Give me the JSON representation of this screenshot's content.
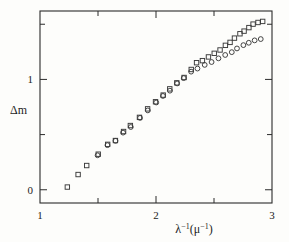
{
  "figure": {
    "background_color": "#fdfdfb",
    "ink_color": "#2b2b2b"
  },
  "chart_data": {
    "type": "scatter",
    "title": "",
    "xlabel": "λ⁻¹(μ⁻¹)",
    "ylabel": "Δm",
    "xlim": [
      1,
      3
    ],
    "ylim": [
      -0.12,
      1.62
    ],
    "grid": false,
    "legend": "none",
    "xticks": [
      1,
      1.5,
      2,
      2.5,
      3
    ],
    "xticklabels": [
      "1",
      "",
      "2",
      "",
      "3"
    ],
    "yticks": [
      0,
      0.5,
      1.0,
      1.5
    ],
    "yticklabels": [
      "0",
      "",
      "1",
      ""
    ],
    "series": [
      {
        "name": "squares",
        "marker": "open-square",
        "points": [
          [
            1.24,
            0.02
          ],
          [
            1.33,
            0.14
          ],
          [
            1.4,
            0.22
          ],
          [
            1.5,
            0.32
          ],
          [
            1.58,
            0.41
          ],
          [
            1.65,
            0.45
          ],
          [
            1.72,
            0.53
          ],
          [
            1.78,
            0.58
          ],
          [
            1.86,
            0.66
          ],
          [
            1.93,
            0.73
          ],
          [
            2.0,
            0.8
          ],
          [
            2.06,
            0.86
          ],
          [
            2.12,
            0.91
          ],
          [
            2.18,
            0.97
          ],
          [
            2.24,
            1.02
          ],
          [
            2.3,
            1.09
          ],
          [
            2.35,
            1.15
          ],
          [
            2.4,
            1.17
          ],
          [
            2.45,
            1.2
          ],
          [
            2.5,
            1.24
          ],
          [
            2.55,
            1.27
          ],
          [
            2.6,
            1.31
          ],
          [
            2.64,
            1.34
          ],
          [
            2.68,
            1.37
          ],
          [
            2.72,
            1.41
          ],
          [
            2.76,
            1.44
          ],
          [
            2.8,
            1.47
          ],
          [
            2.84,
            1.5
          ],
          [
            2.88,
            1.52
          ],
          [
            2.92,
            1.53
          ]
        ]
      },
      {
        "name": "circles",
        "marker": "open-circle",
        "points": [
          [
            1.5,
            0.31
          ],
          [
            1.58,
            0.4
          ],
          [
            1.65,
            0.44
          ],
          [
            1.72,
            0.52
          ],
          [
            1.78,
            0.57
          ],
          [
            1.86,
            0.65
          ],
          [
            1.93,
            0.72
          ],
          [
            2.0,
            0.79
          ],
          [
            2.06,
            0.85
          ],
          [
            2.12,
            0.9
          ],
          [
            2.18,
            0.96
          ],
          [
            2.24,
            1.01
          ],
          [
            2.3,
            1.07
          ],
          [
            2.36,
            1.1
          ],
          [
            2.42,
            1.13
          ],
          [
            2.48,
            1.16
          ],
          [
            2.54,
            1.19
          ],
          [
            2.6,
            1.22
          ],
          [
            2.65,
            1.25
          ],
          [
            2.7,
            1.28
          ],
          [
            2.75,
            1.31
          ],
          [
            2.8,
            1.33
          ],
          [
            2.85,
            1.35
          ],
          [
            2.9,
            1.37
          ]
        ]
      }
    ]
  }
}
